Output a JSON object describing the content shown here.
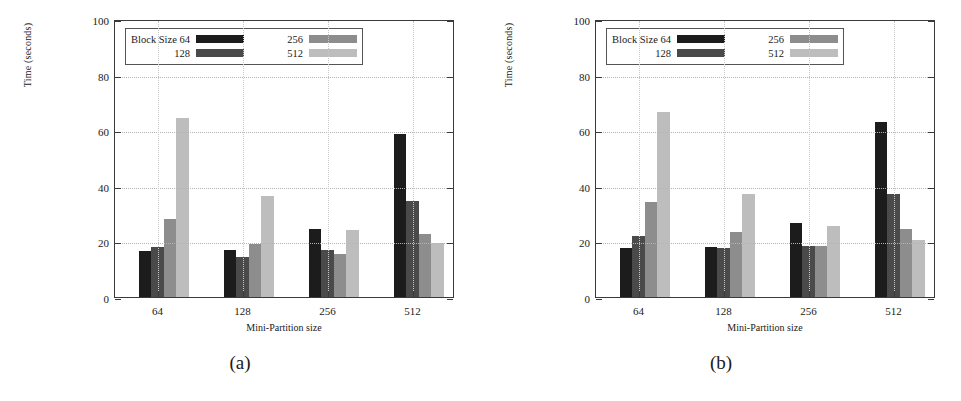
{
  "figure": {
    "panels": [
      {
        "caption": "(a)",
        "axis": {
          "ylabel": "Time (seconds)",
          "xlabel": "Mini-Partition size",
          "yticks": [
            0,
            20,
            40,
            60,
            80,
            100
          ],
          "ylim": [
            0,
            100
          ],
          "xticks": [
            "64",
            "128",
            "256",
            "512"
          ]
        },
        "legend": {
          "title": "Block Size 64",
          "entries": [
            "Block Size 64",
            "128",
            "256",
            "512"
          ],
          "colors": [
            "#1c1c1c",
            "#4a4a4a",
            "#8d8d8d",
            "#bdbdbd"
          ]
        }
      },
      {
        "caption": "(b)",
        "axis": {
          "ylabel": "Time (seconds)",
          "xlabel": "Mini-Partition size",
          "yticks": [
            0,
            20,
            40,
            60,
            80,
            100
          ],
          "ylim": [
            0,
            100
          ],
          "xticks": [
            "64",
            "128",
            "256",
            "512"
          ]
        },
        "legend": {
          "title": "Block Size 64",
          "entries": [
            "Block Size 64",
            "128",
            "256",
            "512"
          ],
          "colors": [
            "#1c1c1c",
            "#4a4a4a",
            "#8d8d8d",
            "#bdbdbd"
          ]
        }
      }
    ]
  },
  "chart_data": [
    {
      "type": "bar",
      "title": "(a)",
      "xlabel": "Mini-Partition size",
      "ylabel": "Time (seconds)",
      "ylim": [
        0,
        100
      ],
      "yticks": [
        0,
        20,
        40,
        60,
        80,
        100
      ],
      "grid": true,
      "legend_position": "top-left-inside",
      "categories": [
        "64",
        "128",
        "256",
        "512"
      ],
      "series": [
        {
          "name": "Block Size 64",
          "color": "#1c1c1c",
          "values": [
            16.5,
            17.0,
            24.5,
            58.5
          ]
        },
        {
          "name": "128",
          "color": "#4a4a4a",
          "values": [
            18.0,
            14.5,
            17.0,
            34.5
          ]
        },
        {
          "name": "256",
          "color": "#8d8d8d",
          "values": [
            28.0,
            19.0,
            15.5,
            22.5
          ]
        },
        {
          "name": "512",
          "color": "#bdbdbd",
          "values": [
            64.5,
            36.5,
            24.0,
            19.5
          ]
        }
      ]
    },
    {
      "type": "bar",
      "title": "(b)",
      "xlabel": "Mini-Partition size",
      "ylabel": "Time (seconds)",
      "ylim": [
        0,
        100
      ],
      "yticks": [
        0,
        20,
        40,
        60,
        80,
        100
      ],
      "grid": true,
      "legend_position": "top-left-inside",
      "categories": [
        "64",
        "128",
        "256",
        "512"
      ],
      "series": [
        {
          "name": "Block Size 64",
          "color": "#1c1c1c",
          "values": [
            17.5,
            18.0,
            26.5,
            63.0
          ]
        },
        {
          "name": "128",
          "color": "#4a4a4a",
          "values": [
            22.0,
            17.5,
            18.5,
            37.0
          ]
        },
        {
          "name": "256",
          "color": "#8d8d8d",
          "values": [
            34.0,
            23.5,
            18.5,
            24.5
          ]
        },
        {
          "name": "512",
          "color": "#bdbdbd",
          "values": [
            66.5,
            37.0,
            25.5,
            20.5
          ]
        }
      ]
    }
  ]
}
